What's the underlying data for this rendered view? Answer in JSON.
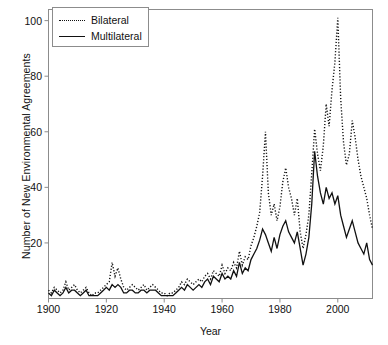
{
  "chart_data": {
    "type": "line",
    "title": "",
    "xlabel": "Year",
    "ylabel": "Number of New Environmental Agreements",
    "xlim": [
      1900,
      2012
    ],
    "ylim": [
      0,
      104
    ],
    "xticks": [
      1900,
      1920,
      1940,
      1960,
      1980,
      2000
    ],
    "yticks": [
      20,
      40,
      60,
      80,
      100
    ],
    "grid": false,
    "legend_position": "top-left",
    "legend": [
      "Bilateral",
      "Multilateral"
    ],
    "x": [
      1900,
      1901,
      1902,
      1903,
      1904,
      1905,
      1906,
      1907,
      1908,
      1909,
      1910,
      1911,
      1912,
      1913,
      1914,
      1915,
      1916,
      1917,
      1918,
      1919,
      1920,
      1921,
      1922,
      1923,
      1924,
      1925,
      1926,
      1927,
      1928,
      1929,
      1930,
      1931,
      1932,
      1933,
      1934,
      1935,
      1936,
      1937,
      1938,
      1939,
      1940,
      1941,
      1942,
      1943,
      1944,
      1945,
      1946,
      1947,
      1948,
      1949,
      1950,
      1951,
      1952,
      1953,
      1954,
      1955,
      1956,
      1957,
      1958,
      1959,
      1960,
      1961,
      1962,
      1963,
      1964,
      1965,
      1966,
      1967,
      1968,
      1969,
      1970,
      1971,
      1972,
      1973,
      1974,
      1975,
      1976,
      1977,
      1978,
      1979,
      1980,
      1981,
      1982,
      1983,
      1984,
      1985,
      1986,
      1987,
      1988,
      1989,
      1990,
      1991,
      1992,
      1993,
      1994,
      1995,
      1996,
      1997,
      1998,
      1999,
      2000,
      2001,
      2002,
      2003,
      2004,
      2005,
      2006,
      2007,
      2008,
      2009,
      2010,
      2011,
      2012
    ],
    "series": [
      {
        "name": "Bilateral",
        "style": "dotted",
        "color": "#111111",
        "values": [
          3,
          2,
          4,
          3,
          2,
          3,
          6,
          3,
          4,
          5,
          3,
          2,
          3,
          4,
          2,
          1,
          2,
          2,
          3,
          4,
          5,
          6,
          13,
          8,
          11,
          7,
          4,
          3,
          4,
          5,
          4,
          3,
          4,
          5,
          3,
          4,
          5,
          4,
          3,
          2,
          2,
          1,
          2,
          2,
          3,
          4,
          6,
          5,
          7,
          6,
          5,
          6,
          7,
          6,
          8,
          9,
          7,
          10,
          9,
          8,
          12,
          9,
          11,
          10,
          13,
          11,
          17,
          12,
          15,
          14,
          19,
          22,
          26,
          31,
          44,
          60,
          38,
          30,
          34,
          28,
          33,
          42,
          47,
          40,
          36,
          30,
          36,
          24,
          18,
          23,
          30,
          45,
          61,
          52,
          46,
          55,
          70,
          62,
          75,
          85,
          101,
          72,
          56,
          48,
          52,
          64,
          58,
          50,
          44,
          40,
          36,
          30,
          25
        ]
      },
      {
        "name": "Multilateral",
        "style": "solid",
        "color": "#111111",
        "values": [
          2,
          1,
          3,
          2,
          1,
          2,
          4,
          2,
          3,
          3,
          2,
          1,
          2,
          3,
          1,
          1,
          1,
          1,
          2,
          3,
          4,
          3,
          5,
          4,
          5,
          4,
          2,
          2,
          3,
          3,
          2,
          2,
          3,
          3,
          2,
          3,
          3,
          3,
          2,
          1,
          1,
          1,
          1,
          1,
          2,
          3,
          4,
          3,
          5,
          4,
          3,
          4,
          5,
          4,
          6,
          7,
          5,
          8,
          7,
          6,
          9,
          7,
          8,
          7,
          10,
          8,
          13,
          9,
          11,
          10,
          14,
          16,
          18,
          21,
          25,
          23,
          20,
          17,
          22,
          18,
          23,
          26,
          28,
          24,
          22,
          20,
          24,
          18,
          12,
          16,
          22,
          34,
          53,
          44,
          38,
          34,
          40,
          36,
          38,
          34,
          37,
          30,
          26,
          22,
          25,
          28,
          24,
          20,
          18,
          16,
          20,
          14,
          12
        ]
      }
    ]
  }
}
